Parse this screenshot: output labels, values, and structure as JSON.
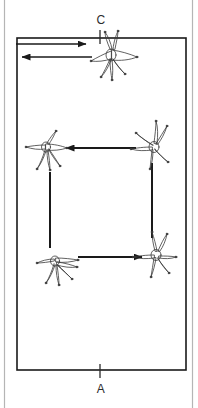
{
  "diagram": {
    "type": "arena-pattern",
    "markers": [
      {
        "id": "C",
        "label": "C",
        "position": "top-center"
      },
      {
        "id": "A",
        "label": "A",
        "position": "bottom-center"
      }
    ],
    "arena": {
      "shape": "rectangle",
      "outer_border_color": "#b0b0b0",
      "inner_border_color": "#1a1a1a",
      "fill_color": "#ffffff"
    },
    "figures": [
      {
        "id": "figure-top",
        "name": "horse-and-rider-top",
        "position": "top-center",
        "facing": "left",
        "x": 110,
        "y": 58
      },
      {
        "id": "figure-upper-left",
        "name": "horse-and-rider-upper-left",
        "position": "upper-left",
        "facing": "left",
        "x": 45,
        "y": 148
      },
      {
        "id": "figure-upper-right",
        "name": "horse-and-rider-upper-right",
        "position": "upper-right",
        "facing": "left",
        "x": 152,
        "y": 145
      },
      {
        "id": "figure-lower-right",
        "name": "horse-and-rider-lower-right",
        "position": "lower-right",
        "facing": "right",
        "x": 155,
        "y": 253
      },
      {
        "id": "figure-lower-left",
        "name": "horse-and-rider-lower-left",
        "position": "lower-left",
        "facing": "right",
        "x": 55,
        "y": 263
      }
    ],
    "arrows": [
      {
        "id": "arrow-top-right",
        "name": "arrow-top-outbound",
        "direction": "right",
        "x1": 16,
        "y1": 44,
        "x2": 92,
        "y2": 44
      },
      {
        "id": "arrow-top-left",
        "name": "arrow-top-inbound",
        "direction": "left",
        "x1": 92,
        "y1": 56,
        "x2": 16,
        "y2": 56
      },
      {
        "id": "arrow-middle",
        "name": "arrow-middle-horizontal",
        "direction": "left",
        "x1": 136,
        "y1": 148,
        "x2": 62,
        "y2": 148
      },
      {
        "id": "arrow-bottom",
        "name": "arrow-bottom-horizontal",
        "direction": "right",
        "x1": 78,
        "y1": 257,
        "x2": 148,
        "y2": 257
      },
      {
        "id": "line-left",
        "name": "line-left-vertical",
        "direction": "none",
        "x1": 50,
        "y1": 170,
        "x2": 50,
        "y2": 248
      },
      {
        "id": "line-right",
        "name": "line-right-vertical",
        "direction": "none",
        "x1": 152,
        "y1": 165,
        "x2": 152,
        "y2": 238
      }
    ],
    "tick_marks": [
      {
        "id": "tick-c",
        "name": "tick-mark-c",
        "x": 100,
        "y1": 30,
        "y2": 42
      },
      {
        "id": "tick-a",
        "name": "tick-mark-a",
        "x": 100,
        "y1": 366,
        "y2": 378
      }
    ]
  }
}
